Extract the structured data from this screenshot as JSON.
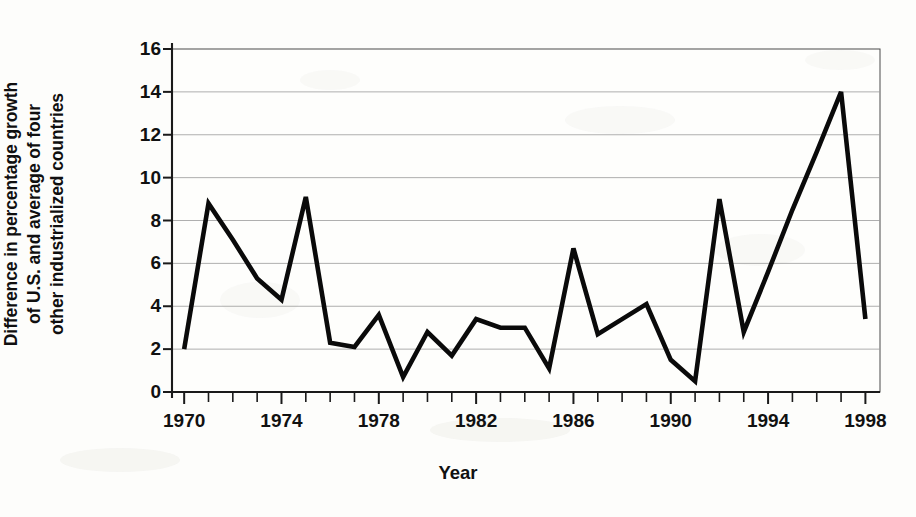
{
  "chart_data": {
    "type": "line",
    "title": "",
    "xlabel": "Year",
    "ylabel": "Difference in percentage growth of U.S. and average of four other industrialized countries",
    "ylabel_lines": [
      "Difference in percentage growth",
      "of U.S. and average of four",
      "other industrialized countries"
    ],
    "x": [
      1970,
      1971,
      1972,
      1973,
      1974,
      1975,
      1976,
      1977,
      1978,
      1979,
      1980,
      1981,
      1982,
      1983,
      1984,
      1985,
      1986,
      1987,
      1988,
      1989,
      1990,
      1991,
      1992,
      1993,
      1994,
      1995,
      1996,
      1997,
      1998
    ],
    "values": [
      2.0,
      8.8,
      7.1,
      5.3,
      4.3,
      9.1,
      2.3,
      2.1,
      3.6,
      0.7,
      2.8,
      1.7,
      3.4,
      3.0,
      3.0,
      1.1,
      6.7,
      2.7,
      3.4,
      4.1,
      1.5,
      0.5,
      9.0,
      2.8,
      5.6,
      8.5,
      11.2,
      14.0,
      3.4
    ],
    "xlim": [
      1969.5,
      1998.6
    ],
    "ylim": [
      0,
      16
    ],
    "xticks_major": [
      1970,
      1974,
      1978,
      1982,
      1986,
      1990,
      1994,
      1998
    ],
    "xtick_labels": [
      "1970",
      "1974",
      "1978",
      "1982",
      "1986",
      "1990",
      "1994",
      "1998"
    ],
    "xticks_minor_step": 1,
    "yticks": [
      0,
      2,
      4,
      6,
      8,
      10,
      12,
      14,
      16
    ],
    "ytick_labels": [
      "0",
      "2",
      "4",
      "6",
      "8",
      "10",
      "12",
      "14",
      "16"
    ],
    "grid": true,
    "grid_axis": "y",
    "legend": false,
    "legend_position": "none",
    "line_color": "#0a0a0a",
    "grid_color": "#9a9a9a",
    "background_color": "#fdfdfb"
  }
}
